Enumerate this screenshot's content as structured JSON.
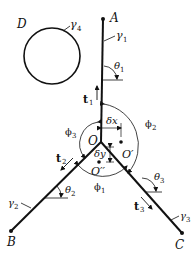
{
  "diagram": {
    "type": "triple-junction",
    "points": {
      "A": "A",
      "B": "B",
      "C": "C",
      "D": "D",
      "O": "O",
      "O_prime": "O′",
      "O_double_prime": "O′′"
    },
    "curves": {
      "gamma1": "γ",
      "gamma1_sub": "1",
      "gamma2": "γ",
      "gamma2_sub": "2",
      "gamma3": "γ",
      "gamma3_sub": "3",
      "gamma4": "γ",
      "gamma4_sub": "4"
    },
    "tangents": {
      "t1": "t",
      "t1_sub": "1",
      "t2": "t",
      "t2_sub": "2",
      "t3": "t",
      "t3_sub": "3"
    },
    "angles": {
      "theta1": "θ",
      "theta1_sub": "1",
      "theta2": "θ",
      "theta2_sub": "2",
      "theta3": "θ",
      "theta3_sub": "3",
      "phi1": "ϕ",
      "phi1_sub": "1",
      "phi2": "ϕ",
      "phi2_sub": "2",
      "phi3": "ϕ",
      "phi3_sub": "3"
    },
    "displacements": {
      "dx": "δx",
      "dy": "δy"
    },
    "colors": {
      "stroke": "#111111",
      "background": "#ffffff"
    }
  }
}
